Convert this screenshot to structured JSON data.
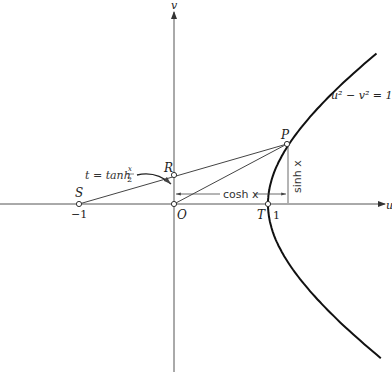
{
  "diagram": {
    "axes": {
      "u_label": "u",
      "v_label": "v"
    },
    "points": {
      "S": {
        "label": "S",
        "coord_label": "−1"
      },
      "O": {
        "label": "O"
      },
      "R": {
        "label": "R"
      },
      "T": {
        "label": "T",
        "coord_label": "1"
      },
      "P": {
        "label": "P"
      }
    },
    "curve_label": "u² − v² = 1",
    "dimension_labels": {
      "horizontal": "cosh x",
      "vertical": "sinh x"
    },
    "annotation": {
      "lhs": "t = tanh ",
      "frac_num": "x",
      "frac_den": "2"
    },
    "colors": {
      "ink": "#222222",
      "background": "#ffffff"
    }
  }
}
